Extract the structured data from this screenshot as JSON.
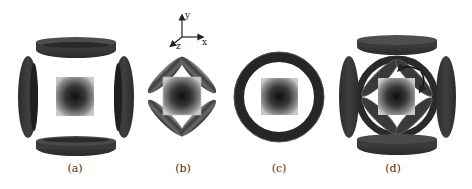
{
  "figure": {
    "panels": [
      {
        "id": "a",
        "label": "(a)",
        "configuration": "four ring coils arranged on square sides (top, bottom, left, right)"
      },
      {
        "id": "b",
        "label": "(b)",
        "configuration": "four elongated coils tilted 45 degrees forming a diamond"
      },
      {
        "id": "c",
        "label": "(c)",
        "configuration": "single circular ring coil"
      },
      {
        "id": "d",
        "label": "(d)",
        "configuration": "combined: four side coils plus diamond coils with curved arrows"
      }
    ],
    "axes": {
      "y": "y",
      "x": "x",
      "z": "z"
    },
    "colors": {
      "coil_dark": "#3a3a3a",
      "coil_mid": "#5a5a5a",
      "coil_light": "#8a8a8a",
      "field_center": "#111111",
      "field_edge": "#d8d8d8",
      "background": "#ffffff"
    }
  }
}
